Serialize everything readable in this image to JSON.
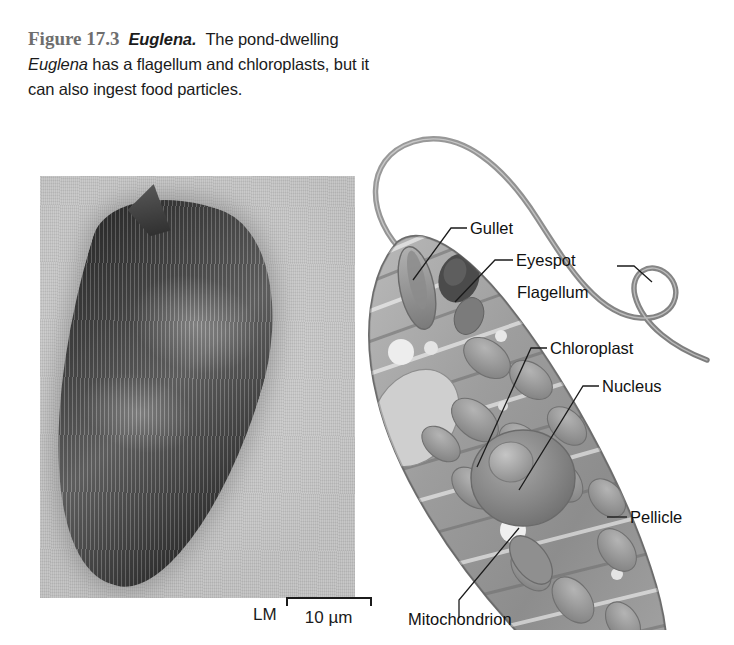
{
  "figure": {
    "number": "Figure 17.3",
    "organism": "Euglena.",
    "caption_part1": "The pond-dwelling ",
    "caption_organism_inline": "Euglena",
    "caption_part2": " has a flagellum and chloroplasts, but it can also ingest food particles."
  },
  "micrograph": {
    "technique_label": "LM",
    "scale_value": "10 µm",
    "background_color": "#c6c6c6",
    "specimen_color": "#3a3a3a"
  },
  "diagram": {
    "labels": [
      {
        "id": "gullet",
        "text": "Gullet"
      },
      {
        "id": "eyespot",
        "text": "Eyespot"
      },
      {
        "id": "flagellum",
        "text": "Flagellum"
      },
      {
        "id": "chloroplast",
        "text": "Chloroplast"
      },
      {
        "id": "nucleus",
        "text": "Nucleus"
      },
      {
        "id": "pellicle",
        "text": "Pellicle"
      },
      {
        "id": "mitochondrion",
        "text": "Mitochondrion"
      }
    ],
    "leader_line_color": "#1b1b1b",
    "cell_fill_color": "#9a9a9a"
  }
}
